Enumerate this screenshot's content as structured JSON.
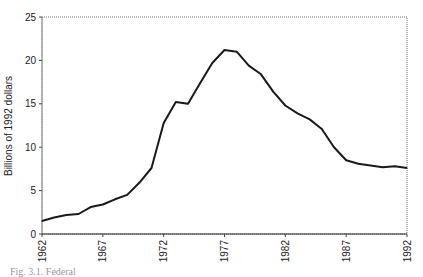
{
  "chart_data": {
    "type": "line",
    "title": "",
    "xlabel": "",
    "ylabel": "Billions of 1992 dollars",
    "xlim": [
      1962,
      1992
    ],
    "ylim": [
      0,
      25
    ],
    "grid": false,
    "legend": null,
    "x_ticks": [
      "1962",
      "1967",
      "1972",
      "1977",
      "1982",
      "1987",
      "1992"
    ],
    "y_ticks": [
      "0",
      "5",
      "10",
      "15",
      "20",
      "25"
    ],
    "series": [
      {
        "name": "Billions of 1992 dollars",
        "x": [
          1962,
          1963,
          1964,
          1965,
          1966,
          1967,
          1968,
          1969,
          1970,
          1971,
          1972,
          1973,
          1974,
          1975,
          1976,
          1977,
          1978,
          1979,
          1980,
          1981,
          1982,
          1983,
          1984,
          1985,
          1986,
          1987,
          1988,
          1989,
          1990,
          1991,
          1992
        ],
        "values": [
          1.5,
          1.9,
          2.2,
          2.3,
          3.1,
          3.4,
          4.0,
          4.5,
          5.9,
          7.6,
          12.8,
          15.2,
          15.0,
          17.4,
          19.7,
          21.2,
          21.0,
          19.4,
          18.4,
          16.4,
          14.8,
          13.9,
          13.2,
          12.1,
          10.0,
          8.5,
          8.1,
          7.9,
          7.7,
          7.8,
          7.6
        ]
      }
    ]
  },
  "caption": "Fig. 3.1. Federal"
}
